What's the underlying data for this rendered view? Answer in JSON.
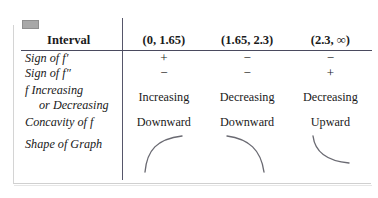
{
  "figure": {
    "type": "table",
    "corner_tab": "gray-tab-marker"
  },
  "table": {
    "columns": [
      {
        "key": "label",
        "header": "Interval"
      },
      {
        "key": "i1",
        "header": "(0, 1.65)"
      },
      {
        "key": "i2",
        "header": "(1.65, 2.3)"
      },
      {
        "key": "i3",
        "header": "(2.3, ∞)"
      }
    ],
    "rows": [
      {
        "name": "sign-of-f-prime",
        "label": "Sign of f′",
        "label_line2": "",
        "values": [
          "+",
          "−",
          "−"
        ]
      },
      {
        "name": "sign-of-f-double-prime",
        "label": "Sign of f″",
        "label_line2": "",
        "values": [
          "−",
          "−",
          "+"
        ]
      },
      {
        "name": "increasing-or-decreasing",
        "label": "f Increasing",
        "label_line2": "or Decreasing",
        "values": [
          "Increasing",
          "Decreasing",
          "Decreasing"
        ]
      },
      {
        "name": "concavity-of-f",
        "label": "Concavity of f",
        "label_line2": "",
        "values": [
          "Downward",
          "Downward",
          "Upward"
        ]
      },
      {
        "name": "shape-of-graph",
        "label": "Shape of Graph",
        "label_line2": "",
        "values": [
          "increasing-concave-down-curve",
          "decreasing-concave-down-curve",
          "decreasing-concave-up-curve"
        ]
      }
    ]
  },
  "colors": {
    "rule": "#4a4a5e",
    "divider": "#56566a",
    "curve": "#6a6a72",
    "frame": "#d4d4d4",
    "tab": "#a8a8a8",
    "text": "#1a1a1a"
  }
}
